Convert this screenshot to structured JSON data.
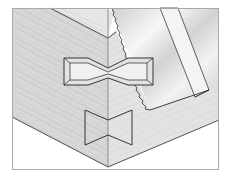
{
  "figure": {
    "elements": [
      "box-corner",
      "horizontal-butterfly-key",
      "vertical-butterfly-key",
      "handsaw-blade",
      "frame-border"
    ]
  },
  "colors": {
    "background": "#ffffff",
    "frame": "#a8a8a8",
    "wood_left": "#d9d9d9",
    "wood_right": "#e4e4e4",
    "wood_top": "#e9e9e9",
    "saw_blade": "#dcdcdc",
    "saw_highlight": "#f6f6f6",
    "outline": "#2a2a2a",
    "grain": "#b5b5b5"
  }
}
